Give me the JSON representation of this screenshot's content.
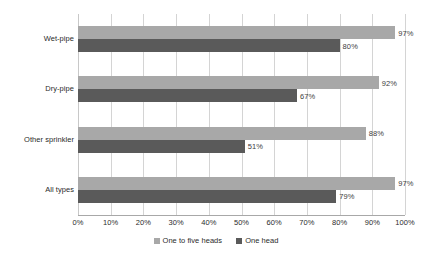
{
  "chart_data": {
    "type": "bar",
    "orientation": "horizontal",
    "title": "",
    "subtitle": "",
    "xlabel": "",
    "ylabel": "",
    "xlim": [
      0,
      100
    ],
    "xtick_labels": [
      "0%",
      "10%",
      "20%",
      "30%",
      "40%",
      "50%",
      "60%",
      "70%",
      "80%",
      "90%",
      "100%"
    ],
    "xtick_values": [
      0,
      10,
      20,
      30,
      40,
      50,
      60,
      70,
      80,
      90,
      100
    ],
    "grid": "vertical",
    "legend_position": "bottom",
    "categories": [
      "Wet-pipe",
      "Dry-pipe",
      "Other sprinkler",
      "All types"
    ],
    "series": [
      {
        "name": "One to five heads",
        "color": "#a8a8a8",
        "values": [
          97,
          92,
          88,
          97
        ],
        "labels": [
          "97%",
          "92%",
          "88%",
          "97%"
        ]
      },
      {
        "name": "One head",
        "color": "#5a5a5a",
        "values": [
          80,
          67,
          51,
          79
        ],
        "labels": [
          "80%",
          "67%",
          "51%",
          "79%"
        ]
      }
    ]
  },
  "legend": {
    "items": [
      {
        "label": "One to five heads",
        "swatch": "series-light"
      },
      {
        "label": "One head",
        "swatch": "series-dark"
      }
    ]
  }
}
